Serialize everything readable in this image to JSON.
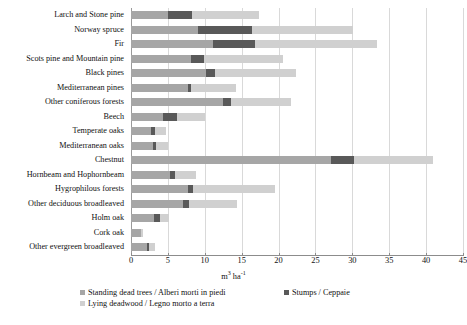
{
  "chart_data": {
    "type": "bar",
    "orientation": "horizontal",
    "stacked": true,
    "title": "",
    "subtitle": "",
    "xlabel": "m3 ha-1",
    "xlabel_base": "m",
    "xlabel_sup1": "3",
    "xlabel_unit": " ha",
    "xlabel_sup2": "-1",
    "ylabel": "",
    "xlim": [
      0,
      45
    ],
    "xticks": [
      0,
      5,
      10,
      15,
      20,
      25,
      30,
      35,
      40,
      45
    ],
    "grid": "vertical",
    "legend_position": "bottom",
    "categories": [
      "Larch and Stone pine",
      "Norway spruce",
      "Fir",
      "Scots pine and Mountain pine",
      "Black pines",
      "Mediterranean pines",
      "Other coniferous forests",
      "Beech",
      "Temperate oaks",
      "Mediterranean oaks",
      "Chestnut",
      "Hornbeam and Hophornbeam",
      "Hygrophilous forests",
      "Other deciduous broadleaved",
      "Holm oak",
      "Cork oak",
      "Other evergreen broadleaved"
    ],
    "series": [
      {
        "name": "Standing dead trees / Alberi morti in piedi",
        "color": "#a6a6a6",
        "values": [
          5.0,
          9.1,
          11.1,
          8.1,
          10.2,
          7.7,
          12.5,
          4.3,
          2.7,
          3.0,
          27.1,
          5.3,
          7.7,
          7.0,
          3.1,
          1.3,
          2.2
        ]
      },
      {
        "name": "Stumps / Ceppaie",
        "color": "#595959",
        "values": [
          3.3,
          7.3,
          5.7,
          1.8,
          1.2,
          0.4,
          1.1,
          1.9,
          0.5,
          0.4,
          3.1,
          0.7,
          0.7,
          0.9,
          0.8,
          0.1,
          0.2
        ]
      },
      {
        "name": "Lying deadwood / Legno morto a terra",
        "color": "#d0d0d0",
        "values": [
          9.0,
          13.7,
          16.6,
          10.7,
          11.0,
          6.2,
          8.1,
          3.8,
          1.6,
          1.6,
          10.7,
          2.8,
          11.1,
          6.5,
          1.2,
          0.2,
          0.9
        ]
      }
    ],
    "totals": [
      17.3,
      30.1,
      33.4,
      20.6,
      22.4,
      14.3,
      21.7,
      10.0,
      4.8,
      5.0,
      40.9,
      8.8,
      19.5,
      14.4,
      5.1,
      1.6,
      3.3
    ]
  },
  "legend": {
    "items": [
      {
        "label": "Standing dead trees / Alberi morti in piedi",
        "color": "#a6a6a6"
      },
      {
        "label": "Stumps / Ceppaie",
        "color": "#595959"
      },
      {
        "label": "Lying deadwood / Legno morto a terra",
        "color": "#d0d0d0"
      }
    ]
  },
  "colors": {
    "standing": "#a6a6a6",
    "stumps": "#595959",
    "lying": "#d0d0d0",
    "grid": "#d9d9d9",
    "axis": "#8c8c8c",
    "background": "#ffffff"
  }
}
